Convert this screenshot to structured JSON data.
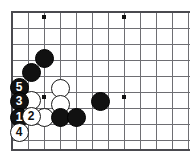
{
  "diagram": {
    "kind": "go-board-diagram",
    "board": {
      "background_color": "#ffffff",
      "line_color": "#6e6e73",
      "edge_color": "#4a4a4f",
      "grid_spacing": 16,
      "origin_x": 12,
      "origin_y": 12,
      "cols": 11,
      "rows": 9,
      "edges": {
        "left": true,
        "top": true,
        "bottom": true,
        "right": false
      }
    },
    "star_points": [
      {
        "name": "star-point-top-left",
        "cx": 44,
        "cy": 17
      },
      {
        "name": "star-point-top-right",
        "cx": 124,
        "cy": 17
      },
      {
        "name": "star-point-mid-left",
        "cx": 44,
        "cy": 97
      },
      {
        "name": "star-point-mid-right",
        "cx": 124,
        "cy": 97
      }
    ],
    "stone_radius": 9.5,
    "stones": [
      {
        "id": "b-a",
        "color": "black",
        "label": "",
        "cx": 44,
        "cy": 58
      },
      {
        "id": "b-b",
        "color": "black",
        "label": "",
        "cx": 31,
        "cy": 72
      },
      {
        "id": "w-a",
        "color": "white",
        "label": "",
        "cx": 60,
        "cy": 88
      },
      {
        "id": "w-b",
        "color": "white",
        "label": "",
        "cx": 60,
        "cy": 104
      },
      {
        "id": "w-c",
        "color": "white",
        "label": "",
        "cx": 31,
        "cy": 100
      },
      {
        "id": "w-d",
        "color": "white",
        "label": "",
        "cx": 44,
        "cy": 117
      },
      {
        "id": "b-c",
        "color": "black",
        "label": "",
        "cx": 60,
        "cy": 117
      },
      {
        "id": "b-d",
        "color": "black",
        "label": "",
        "cx": 76,
        "cy": 117
      },
      {
        "id": "b-e",
        "color": "black",
        "label": "",
        "cx": 100,
        "cy": 101
      },
      {
        "id": "m-5",
        "color": "black",
        "label": "5",
        "cx": 19,
        "cy": 87
      },
      {
        "id": "m-3",
        "color": "black",
        "label": "3",
        "cx": 19,
        "cy": 101
      },
      {
        "id": "m-1",
        "color": "black",
        "label": "1",
        "cx": 19,
        "cy": 117
      },
      {
        "id": "m-2",
        "color": "white",
        "label": "2",
        "cx": 31,
        "cy": 116
      },
      {
        "id": "m-4",
        "color": "white",
        "label": "4",
        "cx": 19,
        "cy": 132
      }
    ],
    "move_numbers": [
      "1",
      "2",
      "3",
      "4",
      "5"
    ],
    "legend": {
      "black_label": "Black",
      "white_label": "White"
    }
  }
}
